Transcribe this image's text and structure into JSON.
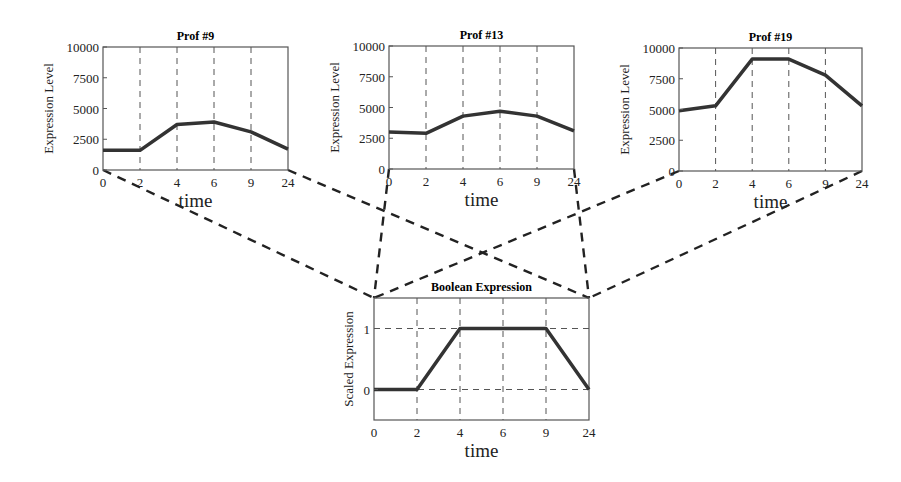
{
  "figure": {
    "connector_style": "dashed black lines linking each profile's t=0 and t=24 corners to the Boolean Expression panel's top corners"
  },
  "chart_data": [
    {
      "type": "line",
      "title": "Prof #9",
      "xlabel": "time",
      "ylabel": "Expression Level",
      "categories": [
        "0",
        "2",
        "4",
        "6",
        "9",
        "24"
      ],
      "values": [
        1600,
        1600,
        3700,
        3900,
        3100,
        1700
      ],
      "yticks": [
        "0",
        "2500",
        "5000",
        "7500",
        "10000"
      ],
      "ylim": [
        0,
        10000
      ],
      "grid": "vertical dashed at each time point"
    },
    {
      "type": "line",
      "title": "Prof #13",
      "xlabel": "time",
      "ylabel": "Expression Level",
      "categories": [
        "0",
        "2",
        "4",
        "6",
        "9",
        "24"
      ],
      "values": [
        3000,
        2900,
        4300,
        4700,
        4300,
        3100
      ],
      "yticks": [
        "0",
        "2500",
        "5000",
        "7500",
        "10000"
      ],
      "ylim": [
        0,
        10000
      ],
      "grid": "vertical dashed at each time point"
    },
    {
      "type": "line",
      "title": "Prof #19",
      "xlabel": "time",
      "ylabel": "Expression Level",
      "categories": [
        "0",
        "2",
        "4",
        "6",
        "9",
        "24"
      ],
      "values": [
        4900,
        5300,
        9100,
        9100,
        7800,
        5300
      ],
      "yticks": [
        "0",
        "2500",
        "5000",
        "7500",
        "10000"
      ],
      "ylim": [
        0,
        10000
      ],
      "grid": "vertical dashed at each time point"
    },
    {
      "type": "line",
      "title": "Boolean Expression",
      "xlabel": "time",
      "ylabel": "Scaled Expression",
      "categories": [
        "0",
        "2",
        "4",
        "6",
        "9",
        "24"
      ],
      "values": [
        0,
        0,
        1,
        1,
        1,
        0
      ],
      "yticks": [
        "0",
        "1"
      ],
      "ylim": [
        -0.5,
        1.5
      ],
      "grid": "vertical dashed at each time point; horizontal dashed at 0 and 1"
    }
  ],
  "panels": {
    "p1": {
      "title": "Prof #9",
      "ylabel": "Expression Level",
      "xlabel": "time"
    },
    "p2": {
      "title": "Prof #13",
      "ylabel": "Expression Level",
      "xlabel": "time"
    },
    "p3": {
      "title": "Prof #19",
      "ylabel": "Expression Level",
      "xlabel": "time"
    },
    "p4": {
      "title": "Boolean Expression",
      "ylabel": "Scaled Expression",
      "xlabel": "time"
    }
  },
  "colors": {
    "line": "#333333",
    "axis": "#555555",
    "grid": "#555555"
  }
}
